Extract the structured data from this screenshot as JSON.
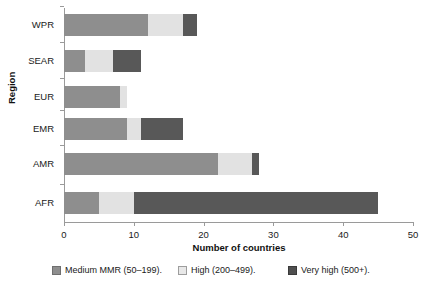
{
  "chart_data": {
    "type": "bar",
    "orientation": "horizontal",
    "stacked": true,
    "title": "",
    "xlabel": "Number of countries",
    "ylabel": "Region",
    "xlim": [
      0,
      50
    ],
    "xticks": [
      0,
      10,
      20,
      30,
      40,
      50
    ],
    "xtick_labels": [
      "0",
      "10",
      "20",
      "30",
      "40",
      "50"
    ],
    "grid": false,
    "legend_position": "bottom",
    "categories": [
      "WPR",
      "SEAR",
      "EUR",
      "EMR",
      "AMR",
      "AFR"
    ],
    "series": [
      {
        "name": "Medium MMR (50–199).",
        "color": "#8e8e8e",
        "values": [
          12,
          3,
          8,
          9,
          22,
          5
        ]
      },
      {
        "name": "High (200–499).",
        "color": "#e2e2e2",
        "values": [
          5,
          4,
          1,
          2,
          5,
          5
        ]
      },
      {
        "name": "Very high (500+).",
        "color": "#585858",
        "values": [
          2,
          4,
          0,
          6,
          1,
          35
        ]
      }
    ],
    "totals": [
      19,
      11,
      9,
      17,
      28,
      45
    ]
  },
  "axes": {
    "x_title": "Number of countries",
    "y_title": "Region",
    "x_tick_labels": [
      "0",
      "10",
      "20",
      "30",
      "40",
      "50"
    ],
    "y_tick_labels": [
      "WPR",
      "SEAR",
      "EUR",
      "EMR",
      "AMR",
      "AFR"
    ]
  },
  "legend": {
    "items": [
      {
        "label": "Medium MMR (50–199).",
        "key": "medium"
      },
      {
        "label": "High (200–499).",
        "key": "high"
      },
      {
        "label": "Very high (500+).",
        "key": "vhigh"
      }
    ]
  },
  "colors": {
    "medium": "#8e8e8e",
    "high": "#e2e2e2",
    "very_high": "#585858",
    "axis": "#9a9a9a",
    "text": "#1a1a1a",
    "background": "#ffffff"
  }
}
